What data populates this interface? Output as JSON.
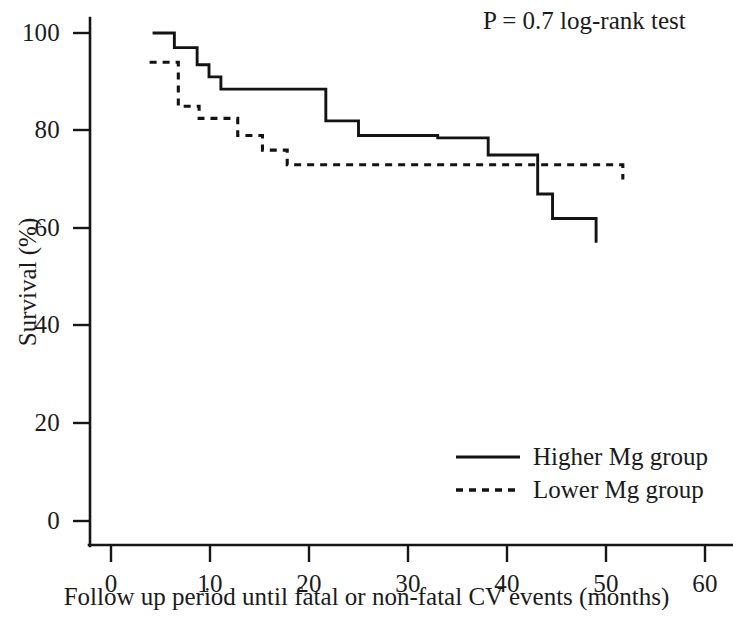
{
  "chart_data": {
    "type": "line",
    "title": "",
    "subtitle": "",
    "xlabel": "Follow up period until fatal or non-fatal CV events (months)",
    "ylabel": "Survival (%)",
    "xlim": [
      -2.5,
      64
    ],
    "ylim": [
      0,
      107
    ],
    "xticks": [
      0,
      10,
      20,
      30,
      40,
      50,
      60
    ],
    "xtick_labels": [
      "0",
      "10",
      "20",
      "30",
      "40",
      "50",
      "60"
    ],
    "yticks": [
      0,
      20,
      40,
      60,
      80,
      100
    ],
    "ytick_labels": [
      "0",
      "20",
      "40",
      "60",
      "80",
      "100"
    ],
    "grid": false,
    "legend_position": "lower right",
    "annotations": [
      {
        "name": "p-value",
        "text": "P = 0.7 log-rank test",
        "x": 40,
        "y": 104
      }
    ],
    "series": [
      {
        "name": "Higher Mg group",
        "linestyle": "solid",
        "color": "#131313",
        "step": "post",
        "x": [
          4.2,
          6.4,
          8.7,
          9.9,
          11.1,
          21.7,
          25.0,
          33.0,
          38.1,
          43.1,
          44.6,
          49.0
        ],
        "y": [
          100,
          97,
          93.5,
          91,
          88.5,
          82,
          79,
          78.5,
          75,
          67,
          62,
          57
        ]
      },
      {
        "name": "Lower Mg group",
        "linestyle": "dashed",
        "color": "#131313",
        "step": "post",
        "x": [
          3.9,
          6.8,
          8.9,
          12.8,
          15.3,
          17.8,
          33.6,
          51.7
        ],
        "y": [
          94,
          85,
          82.5,
          79,
          76,
          73,
          73,
          70
        ]
      }
    ]
  },
  "axes": {
    "y_title": "Survival (%)",
    "x_title": "Follow up period until fatal or non-fatal CV events (months)"
  },
  "annotation": {
    "pvalue_text": "P = 0.7 log-rank test"
  },
  "legend": {
    "items": [
      {
        "label": "Higher Mg group",
        "style": "solid"
      },
      {
        "label": "Lower Mg group",
        "style": "dashed"
      }
    ]
  },
  "yticks": [
    {
      "value": "100"
    },
    {
      "value": "80"
    },
    {
      "value": "60"
    },
    {
      "value": "40"
    },
    {
      "value": "20"
    },
    {
      "value": "0"
    }
  ],
  "xticks": [
    {
      "value": "0"
    },
    {
      "value": "10"
    },
    {
      "value": "20"
    },
    {
      "value": "30"
    },
    {
      "value": "40"
    },
    {
      "value": "50"
    },
    {
      "value": "60"
    }
  ],
  "colors": {
    "axis": "#161616",
    "curve": "#131313",
    "text": "#1b1b1b",
    "background": "#ffffff"
  }
}
